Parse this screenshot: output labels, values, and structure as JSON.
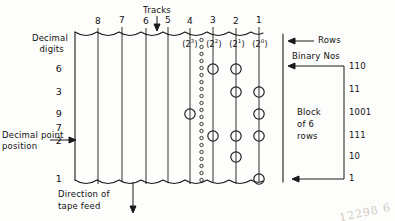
{
  "figure": {
    "title_top": "Tracks",
    "caption_left_line1": "Decimal",
    "caption_left_line2": "digits",
    "decimal_point_line1": "Decimal point",
    "decimal_point_line2": "position",
    "direction_line1": "Direction of",
    "direction_line2": "tape feed",
    "rows_label": "Rows",
    "binary_label": "Binary  Nos",
    "block_line1": "Block",
    "block_line2": "of  6",
    "block_line3": "rows",
    "watermark": "12298 6"
  },
  "tracks": {
    "numbers": [
      "8",
      "7",
      "6",
      "5",
      "4",
      "3",
      "2",
      "1"
    ],
    "powers": [
      "(2",
      "3",
      ")",
      "(2",
      "2",
      ")",
      "(2",
      "1",
      ")",
      "(2",
      "0",
      ")"
    ],
    "power_labels": [
      {
        "track": "4",
        "base": "(2",
        "exp": "3",
        "close": ")"
      },
      {
        "track": "3",
        "base": "(2",
        "exp": "2",
        "close": ")"
      },
      {
        "track": "2",
        "base": "(2",
        "exp": "1",
        "close": ")"
      },
      {
        "track": "1",
        "base": "(2",
        "exp": "0",
        "close": ")"
      }
    ]
  },
  "rows": [
    {
      "decimal": "6",
      "binary": "110",
      "holes": [
        3,
        2
      ]
    },
    {
      "decimal": "3",
      "binary": "11",
      "holes": [
        2,
        1
      ]
    },
    {
      "decimal": "9",
      "binary": "1001",
      "holes": [
        4,
        1
      ]
    },
    {
      "decimal": "7",
      "binary": "111",
      "holes": [
        3,
        2,
        1
      ]
    },
    {
      "decimal": "2",
      "binary": "10",
      "holes": [
        2
      ]
    },
    {
      "decimal": "1",
      "binary": "1",
      "holes": [
        1
      ]
    }
  ],
  "colors": {
    "ink": "#1a1a1a",
    "paper": "#fdfdfb"
  }
}
